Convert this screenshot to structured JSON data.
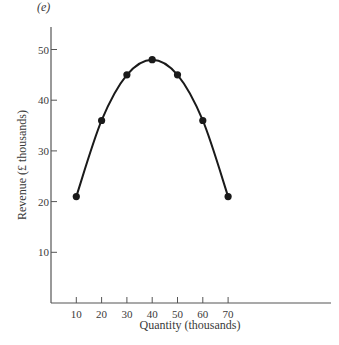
{
  "panel_label": "(e)",
  "chart_data": {
    "type": "line",
    "title": "",
    "xlabel": "Quantity (thousands)",
    "ylabel": "Revenue (£ thousands)",
    "x": [
      10,
      20,
      30,
      40,
      50,
      60,
      70
    ],
    "series": [
      {
        "name": "Revenue",
        "values": [
          21,
          36,
          45,
          48,
          45,
          36,
          21
        ]
      }
    ],
    "x_ticks": [
      10,
      20,
      30,
      40,
      50,
      60,
      70
    ],
    "y_ticks": [
      10,
      20,
      30,
      40,
      50
    ],
    "xlim": [
      0,
      110
    ],
    "ylim": [
      0,
      55
    ],
    "grid": false,
    "legend": "none",
    "smooth_curve": true,
    "markers": "filled-circle",
    "line_color": "#1a1a1a",
    "axis_color": "#555555"
  }
}
